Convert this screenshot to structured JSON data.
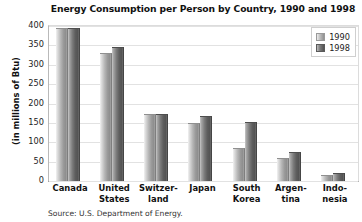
{
  "chart_data": {
    "type": "bar",
    "title": "Energy Consumption per Person by Country, 1990 and 1998",
    "xlabel": "",
    "ylabel": "(in millions of Btu)",
    "ylim": [
      0,
      400
    ],
    "yticks": [
      400,
      350,
      300,
      250,
      200,
      150,
      100,
      50,
      0
    ],
    "grid": true,
    "legend_position": "top-right",
    "categories": [
      "Canada",
      "United States",
      "Switzer-land",
      "Japan",
      "South Korea",
      "Argen-tina",
      "Indo-nesia"
    ],
    "category_lines": [
      [
        "Canada"
      ],
      [
        "United",
        "States"
      ],
      [
        "Switzer-",
        "land"
      ],
      [
        "Japan"
      ],
      [
        "South",
        "Korea"
      ],
      [
        "Argen-",
        "tina"
      ],
      [
        "Indo-",
        "nesia"
      ]
    ],
    "series": [
      {
        "name": "1990",
        "color": "#b0b0b0",
        "values": [
          393,
          328,
          170,
          148,
          82,
          58,
          12
        ]
      },
      {
        "name": "1998",
        "color": "#6b6b6b",
        "values": [
          392,
          344,
          170,
          165,
          150,
          72,
          18
        ]
      }
    ],
    "source": "Source: U.S. Department of Energy."
  },
  "legend": {
    "items": [
      {
        "label": "1990"
      },
      {
        "label": "1998"
      }
    ]
  }
}
